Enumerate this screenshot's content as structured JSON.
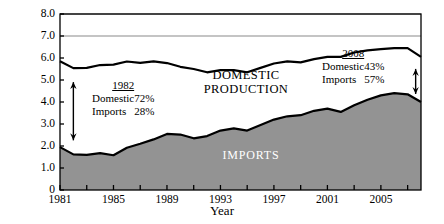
{
  "chart_data": {
    "type": "area",
    "title": "",
    "xlabel": "Year",
    "ylabel": "Billions of Barrels",
    "xlim": [
      1981,
      2008
    ],
    "ylim": [
      0,
      8
    ],
    "yticks": [
      "0",
      "1.0",
      "2.0",
      "3.0",
      "4.0",
      "5.0",
      "6.0",
      "7.0",
      "8.0"
    ],
    "ytick_values": [
      0,
      1,
      2,
      3,
      4,
      5,
      6,
      7,
      8
    ],
    "xticks": [
      "1981",
      "1985",
      "1989",
      "1993",
      "1997",
      "2001",
      "2005"
    ],
    "xtick_values": [
      1981,
      1985,
      1989,
      1993,
      1997,
      2001,
      2005
    ],
    "minor_xtick_values": [
      1983,
      1987,
      1991,
      1995,
      1999,
      2003,
      2007
    ],
    "grid": "horizontal gridlines at 7.0 and 8.0",
    "gridlines": [
      7.0,
      8.0
    ],
    "stacked": true,
    "legend_position": "inline-area-labels",
    "x": [
      1981,
      1982,
      1983,
      1984,
      1985,
      1986,
      1987,
      1988,
      1989,
      1990,
      1991,
      1992,
      1993,
      1994,
      1995,
      1996,
      1997,
      1998,
      1999,
      2000,
      2001,
      2002,
      2003,
      2004,
      2005,
      2006,
      2007,
      2008
    ],
    "series": [
      {
        "name": "IMPORTS",
        "fill": "#939393",
        "values": [
          1.95,
          1.62,
          1.6,
          1.68,
          1.58,
          1.92,
          2.1,
          2.3,
          2.55,
          2.52,
          2.35,
          2.45,
          2.7,
          2.8,
          2.7,
          2.95,
          3.2,
          3.35,
          3.4,
          3.6,
          3.7,
          3.55,
          3.85,
          4.1,
          4.3,
          4.4,
          4.35,
          4.0
        ]
      },
      {
        "name": "DOMESTIC PRODUCTION",
        "fill": "#ffffff",
        "values": [
          3.9,
          3.92,
          3.95,
          4.0,
          4.12,
          3.92,
          3.68,
          3.55,
          3.22,
          3.08,
          3.15,
          2.9,
          2.75,
          2.65,
          2.65,
          2.6,
          2.55,
          2.5,
          2.4,
          2.35,
          2.35,
          2.5,
          2.4,
          2.25,
          2.1,
          2.05,
          2.1,
          2.05
        ]
      }
    ],
    "totals": [
      5.85,
      5.54,
      5.55,
      5.68,
      5.7,
      5.84,
      5.78,
      5.85,
      5.77,
      5.6,
      5.5,
      5.35,
      5.45,
      5.45,
      5.35,
      5.55,
      5.75,
      5.85,
      5.8,
      5.95,
      6.05,
      6.05,
      6.25,
      6.35,
      6.4,
      6.45,
      6.45,
      6.05
    ]
  },
  "annotations": {
    "left": {
      "year": "1982",
      "rows": [
        {
          "label": "Domestic",
          "value": "72%"
        },
        {
          "label": "Imports",
          "value": "28%"
        }
      ]
    },
    "right": {
      "year": "2008",
      "rows": [
        {
          "label": "Domestic",
          "value": "43%"
        },
        {
          "label": "Imports",
          "value": "57%"
        }
      ]
    }
  },
  "area_labels": {
    "domestic_line1": "DOMESTIC",
    "domestic_line2": "PRODUCTION",
    "imports": "IMPORTS"
  },
  "colors": {
    "imports_fill": "#939393",
    "domestic_fill": "#ffffff",
    "curve_stroke": "#000000",
    "gridline": "#8a8a8a",
    "axis": "#000000",
    "imports_text": "#ffffff"
  }
}
